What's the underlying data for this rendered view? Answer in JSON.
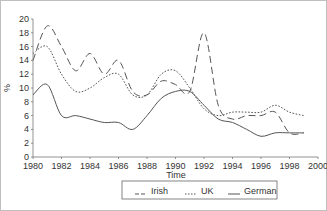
{
  "chart_data": {
    "type": "line",
    "title": "",
    "xlabel": "Time",
    "ylabel": "%",
    "xlim": [
      1980,
      2000
    ],
    "ylim": [
      0,
      20
    ],
    "x_ticks": [
      1980,
      1982,
      1984,
      1986,
      1988,
      1990,
      1992,
      1994,
      1996,
      1998,
      2000
    ],
    "y_ticks": [
      0,
      2,
      4,
      6,
      8,
      10,
      12,
      14,
      16,
      18,
      20
    ],
    "grid": false,
    "legend_position": "bottom",
    "x": [
      1980,
      1981,
      1982,
      1983,
      1984,
      1985,
      1986,
      1987,
      1988,
      1989,
      1990,
      1991,
      1992,
      1993,
      1994,
      1995,
      1996,
      1997,
      1998,
      1999
    ],
    "series": [
      {
        "name": "Irish",
        "style": "dashed",
        "color": "#555555",
        "values": [
          14,
          19,
          16,
          12.5,
          15,
          12,
          14,
          9.5,
          9,
          11,
          10.5,
          9.5,
          18,
          7.5,
          5.5,
          6,
          6,
          6.5,
          3.5,
          3.5
        ]
      },
      {
        "name": "UK",
        "style": "dotted",
        "color": "#555555",
        "values": [
          15,
          16,
          12,
          9.5,
          10,
          11.5,
          12,
          9,
          9,
          12,
          12.5,
          10,
          7,
          6,
          6.5,
          6.5,
          6.5,
          7.5,
          6.5,
          6
        ]
      },
      {
        "name": "German",
        "style": "solid",
        "color": "#555555",
        "values": [
          9,
          10.5,
          6,
          6,
          5.5,
          5,
          5,
          4,
          6,
          8.5,
          9.5,
          9.5,
          7.5,
          5.5,
          5,
          4,
          3,
          3.5,
          3.5,
          3.5
        ]
      }
    ]
  },
  "legend": {
    "items": [
      {
        "label": "Irish",
        "glyph": "_ _"
      },
      {
        "label": "UK",
        "glyph": "...."
      },
      {
        "label": "German",
        "glyph": "___"
      }
    ]
  }
}
